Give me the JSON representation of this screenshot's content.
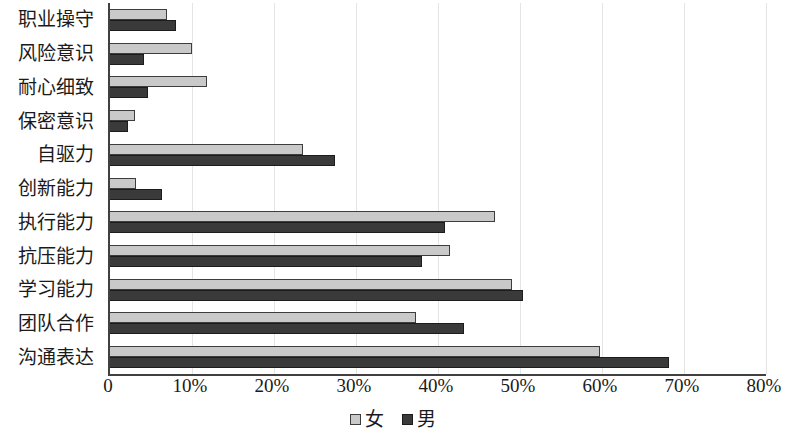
{
  "chart_data": {
    "type": "bar",
    "orientation": "horizontal",
    "title": "",
    "xlabel": "",
    "ylabel": "",
    "xlim": [
      0,
      80
    ],
    "grid": true,
    "legend_position": "bottom-center",
    "xticks": [
      "0",
      "10%",
      "20%",
      "30%",
      "40%",
      "50%",
      "60%",
      "70%",
      "80%"
    ],
    "xtick_values": [
      0,
      10,
      20,
      30,
      40,
      50,
      60,
      70,
      80
    ],
    "categories": [
      "职业操守",
      "风险意识",
      "耐心细致",
      "保密意识",
      "自驱力",
      "创新能力",
      "执行能力",
      "抗压能力",
      "学习能力",
      "团队合作",
      "沟通表达"
    ],
    "series": [
      {
        "name": "女",
        "color": "#c9c9c9",
        "values": [
          7.0,
          10.0,
          11.8,
          3.0,
          23.5,
          3.2,
          47.0,
          41.5,
          49.0,
          37.3,
          59.8
        ]
      },
      {
        "name": "男",
        "color": "#3a3a3a",
        "values": [
          8.0,
          4.2,
          4.6,
          2.2,
          27.4,
          6.3,
          40.8,
          38.0,
          50.4,
          43.2,
          68.2
        ]
      }
    ]
  },
  "legend": {
    "items": [
      {
        "label": "女",
        "swatch": "female"
      },
      {
        "label": "男",
        "swatch": "male"
      }
    ]
  }
}
